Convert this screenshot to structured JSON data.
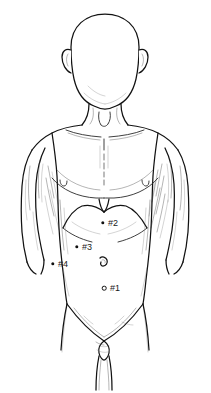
{
  "figure": {
    "view": "anterior",
    "background_color": "#ffffff",
    "line_color": "#111111",
    "shading_color": "#555555"
  },
  "markers": [
    {
      "id": "marker-1",
      "label": "#1",
      "dot_x": 104,
      "dot_y": 288,
      "label_x": 110,
      "label_y": 284,
      "style": "ring",
      "region": "infraumbilical / lower midline"
    },
    {
      "id": "marker-2",
      "label": "#2",
      "dot_x": 103,
      "dot_y": 223,
      "label_x": 108,
      "label_y": 219,
      "style": "solid",
      "region": "epigastric / subxiphoid"
    },
    {
      "id": "marker-3",
      "label": "#3",
      "dot_x": 77,
      "dot_y": 247,
      "label_x": 82,
      "label_y": 243,
      "style": "solid",
      "region": "left upper quadrant"
    },
    {
      "id": "marker-4",
      "label": "#4",
      "dot_x": 53,
      "dot_y": 264,
      "label_x": 58,
      "label_y": 260,
      "style": "solid",
      "region": "left lateral flank"
    }
  ],
  "anatomy_landmarks": [
    {
      "name": "head",
      "cx": 105,
      "cy": 55
    },
    {
      "name": "left-ear",
      "cx": 72,
      "cy": 57
    },
    {
      "name": "right-ear",
      "cx": 138,
      "cy": 57
    },
    {
      "name": "neck",
      "cx": 105,
      "cy": 105
    },
    {
      "name": "suprasternal-notch",
      "cx": 104,
      "cy": 117
    },
    {
      "name": "left-clavicle",
      "cx": 82,
      "cy": 128
    },
    {
      "name": "right-clavicle",
      "cx": 128,
      "cy": 128
    },
    {
      "name": "sternum-midline",
      "cx": 104,
      "cy": 150
    },
    {
      "name": "left-nipple",
      "cx": 63,
      "cy": 183
    },
    {
      "name": "right-nipple",
      "cx": 145,
      "cy": 183
    },
    {
      "name": "xiphoid-process",
      "cx": 104,
      "cy": 205
    },
    {
      "name": "costal-margin",
      "cx": 104,
      "cy": 225
    },
    {
      "name": "umbilicus",
      "cx": 103,
      "cy": 263
    },
    {
      "name": "left-shoulder",
      "cx": 40,
      "cy": 135
    },
    {
      "name": "right-shoulder",
      "cx": 170,
      "cy": 135
    },
    {
      "name": "pubic-region",
      "cx": 104,
      "cy": 345
    }
  ]
}
